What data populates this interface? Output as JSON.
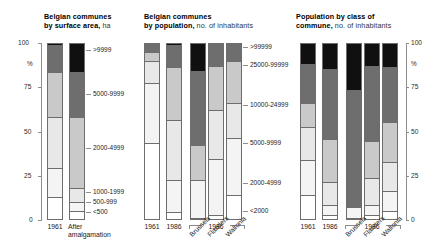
{
  "chart_data": [
    {
      "type": "bar",
      "id": "surface-area",
      "title": "Belgian communes",
      "subtitle_bold": "by surface area,",
      "subtitle_rest": " ha",
      "ylabel": "%",
      "ylim": [
        0,
        100
      ],
      "yticks": [
        0,
        25,
        50,
        75,
        100
      ],
      "ytick_labels": [
        "0",
        "25",
        "50",
        "75",
        "100"
      ],
      "grid": false,
      "legend_position": "right",
      "categories": [
        "1961",
        "After amalgamation"
      ],
      "category_label_lines": [
        [
          "1961"
        ],
        [
          "After",
          "amalgamation"
        ]
      ],
      "series": [
        {
          "name": ">9999",
          "color": "#101010",
          "values": [
            1.0,
            16.5
          ]
        },
        {
          "name": "5000-9999",
          "color": "#6e6e6e",
          "values": [
            15.5,
            26.0
          ]
        },
        {
          "name": "2000-4999",
          "color": "#c9c9c9",
          "values": [
            26.0,
            40.5
          ]
        },
        {
          "name": "1000-1999",
          "color": "#e8e8e8",
          "values": [
            29.0,
            8.0
          ]
        },
        {
          "name": "500-999",
          "color": "#f4f4f4",
          "values": [
            16.5,
            5.0
          ]
        },
        {
          "name": "<500",
          "color": "#ffffff",
          "values": [
            12.0,
            4.0
          ]
        }
      ],
      "legend_entries": [
        ">9999",
        "5000-9999",
        "2000-4999",
        "1000-1999",
        "500-999",
        "<500"
      ]
    },
    {
      "type": "bar",
      "id": "population",
      "title": "Belgian communes",
      "subtitle_bold": "by population,",
      "subtitle_rest": " no. of inhabitants",
      "ylim": [
        0,
        100
      ],
      "yticks": [
        0,
        25,
        50,
        75,
        100
      ],
      "grid": false,
      "legend_position": "right",
      "categories": [
        "1961",
        "1986",
        "Brussels",
        "Flanders",
        "Wallonia"
      ],
      "group_label": "1986",
      "group_members": [
        "Brussels",
        "Flanders",
        "Wallonia"
      ],
      "series": [
        {
          "name": ">99999",
          "color": "#101010",
          "values": [
            0.5,
            1.0,
            16.0,
            0.5,
            0.5
          ]
        },
        {
          "name": "25000-99999",
          "color": "#6e6e6e",
          "values": [
            4.5,
            12.5,
            42.5,
            12.5,
            9.5
          ]
        },
        {
          "name": "10000-24999",
          "color": "#c9c9c9",
          "values": [
            5.5,
            30.5,
            20.0,
            25.0,
            24.0
          ]
        },
        {
          "name": "5000-9999",
          "color": "#e8e8e8",
          "values": [
            12.5,
            34.0,
            0.0,
            28.0,
            20.5
          ]
        },
        {
          "name": "2000-4999",
          "color": "#f4f4f4",
          "values": [
            34.0,
            18.5,
            21.5,
            32.0,
            32.5
          ]
        },
        {
          "name": "<2000",
          "color": "#ffffff",
          "values": [
            43.0,
            3.5,
            0.0,
            2.0,
            13.0
          ]
        }
      ],
      "legend_entries": [
        ">99999",
        "25000-99999",
        "10000-24999",
        "5000-9999",
        "2000-4999",
        "<2000"
      ]
    },
    {
      "type": "bar",
      "id": "population-by-class",
      "title": "Population by class of",
      "subtitle_bold": "commune,",
      "subtitle_rest": " no. of inhabitants",
      "ylabel": "%",
      "ylim": [
        0,
        100
      ],
      "yticks": [
        0,
        25,
        50,
        75,
        100
      ],
      "ytick_labels": [
        "0",
        "25",
        "50",
        "75",
        "100"
      ],
      "grid": false,
      "legend_position": "left",
      "categories": [
        "1961",
        "1986",
        "Brussels",
        "Flanders",
        "Wallonia"
      ],
      "group_label": "1986",
      "group_members": [
        "Brussels",
        "Flanders",
        "Wallonia"
      ],
      "series": [
        {
          "name": ">99999",
          "color": "#101010",
          "values": [
            12.0,
            15.0,
            27.0,
            13.0,
            13.5
          ]
        },
        {
          "name": "25000-99999",
          "color": "#6e6e6e",
          "values": [
            22.0,
            40.0,
            66.5,
            43.0,
            31.5
          ]
        },
        {
          "name": "10000-24999",
          "color": "#c9c9c9",
          "values": [
            14.0,
            24.5,
            0.0,
            21.0,
            23.0
          ]
        },
        {
          "name": "5000-9999",
          "color": "#e8e8e8",
          "values": [
            19.0,
            13.0,
            0.0,
            15.5,
            16.5
          ]
        },
        {
          "name": "2000-4999",
          "color": "#f4f4f4",
          "values": [
            20.0,
            6.0,
            6.5,
            6.0,
            11.5
          ]
        },
        {
          "name": "<2000",
          "color": "#ffffff",
          "values": [
            13.0,
            1.5,
            0.0,
            1.5,
            4.0
          ]
        }
      ],
      "legend_entries": [
        ">99999",
        "25000-99999",
        "10000-24999",
        "5000-9999",
        "2000-4999",
        "<2000"
      ]
    }
  ]
}
